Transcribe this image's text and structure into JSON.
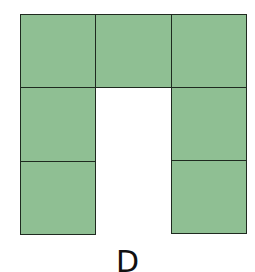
{
  "figure": {
    "label": "D",
    "fill_color": "#8fbf93",
    "border_color": "#1f2a20",
    "grid": {
      "rows": 3,
      "cols": 3
    },
    "cells": [
      {
        "row": 0,
        "col": 0,
        "filled": true
      },
      {
        "row": 0,
        "col": 1,
        "filled": true
      },
      {
        "row": 0,
        "col": 2,
        "filled": true
      },
      {
        "row": 1,
        "col": 0,
        "filled": true
      },
      {
        "row": 1,
        "col": 1,
        "filled": false
      },
      {
        "row": 1,
        "col": 2,
        "filled": true
      },
      {
        "row": 2,
        "col": 0,
        "filled": true
      },
      {
        "row": 2,
        "col": 1,
        "filled": false
      },
      {
        "row": 2,
        "col": 2,
        "filled": true
      }
    ]
  }
}
